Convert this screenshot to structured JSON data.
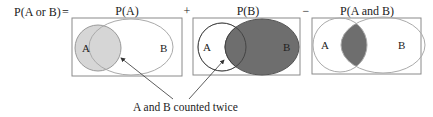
{
  "equation": {
    "lhs": "P(A or B)",
    "equals": "=",
    "plus": "+",
    "minus": "−"
  },
  "panels": [
    {
      "title": "P(A)",
      "label_a": "A",
      "label_b": "B",
      "shaded": "A"
    },
    {
      "title": "P(B)",
      "label_a": "A",
      "label_b": "B",
      "shaded": "B"
    },
    {
      "title": "P(A and B)",
      "label_a": "A",
      "label_b": "B",
      "shaded": "A and B"
    }
  ],
  "annotation": "A and B counted twice",
  "colors": {
    "light_shade": "#d6d6d6",
    "dark_shade": "#6e6e6e",
    "outline": "#999999",
    "box": "#8a8a8a"
  }
}
